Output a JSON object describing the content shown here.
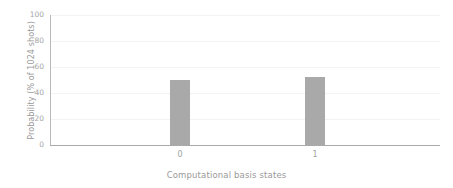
{
  "chart_data": {
    "type": "bar",
    "title": "",
    "subtitle": "",
    "xlabel": "Computational basis states",
    "ylabel": "Probability (% of 1024 shots)",
    "categories": [
      "0",
      "1"
    ],
    "values": [
      50,
      52
    ],
    "series": [
      {
        "name": "probability",
        "values": [
          50,
          52
        ]
      }
    ],
    "ylim": [
      0,
      100
    ],
    "yticks": [
      0,
      20,
      40,
      60,
      80,
      100
    ],
    "ytick_labels": [
      "0",
      "20",
      "40",
      "60",
      "80",
      "100"
    ],
    "xtick_labels": [
      "0",
      "1"
    ],
    "grid": true,
    "grid_axis": "y",
    "legend": false,
    "legend_position": "none",
    "bar_color": "#a9a9a9",
    "grid_color": "#f3f3f3",
    "axis_color": "#a9a9a9",
    "text_color": "#a3a3a3",
    "background_color": "#ffffff"
  },
  "axes": {
    "y_title": "Probability (% of 1024 shots)",
    "x_title": "Computational basis states"
  }
}
